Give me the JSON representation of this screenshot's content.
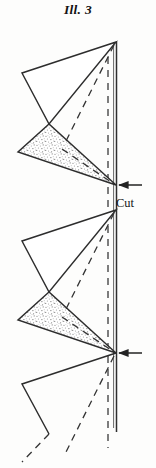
{
  "figure": {
    "title": "Ill. 3",
    "domain_kind": "line-drawing",
    "background_color": "#fdfdfc",
    "ink_color": "#2b2b2b",
    "stipple_color": "#8d8d8d"
  },
  "labels": {
    "cut": "Cut"
  },
  "annotations": [
    {
      "name": "cut-arrow-upper",
      "text": "Cut",
      "arrow_direction": "left",
      "target_x": 116,
      "target_y": 185
    },
    {
      "name": "cut-arrow-lower",
      "text": "",
      "arrow_direction": "left",
      "target_x": 116,
      "target_y": 353
    }
  ],
  "guides": {
    "solid_fold_line": {
      "x": 116,
      "y_top": 42,
      "y_bottom": 432
    },
    "dashed_center_line": {
      "x": 108,
      "y_top": 44,
      "y_bottom": 448
    }
  },
  "units": [
    {
      "name": "unit-upper",
      "apex_x": 116,
      "apex_y": 42,
      "left_vertex_x": 22,
      "left_vertex_y": 73,
      "notch_x": 49,
      "notch_y": 124,
      "shaded_left_x": 18,
      "shaded_left_y": 152,
      "point_x": 116,
      "point_y": 185,
      "shaded": true
    },
    {
      "name": "unit-lower",
      "apex_x": 116,
      "apex_y": 210,
      "left_vertex_x": 22,
      "left_vertex_y": 241,
      "notch_x": 49,
      "notch_y": 292,
      "shaded_left_x": 18,
      "shaded_left_y": 320,
      "point_x": 116,
      "point_y": 353,
      "shaded": true
    },
    {
      "name": "unit-bottom-partial",
      "apex_x": 116,
      "apex_y": 353,
      "left_vertex_x": 22,
      "left_vertex_y": 384,
      "notch_x": 49,
      "notch_y": 434,
      "shaded": false
    }
  ]
}
